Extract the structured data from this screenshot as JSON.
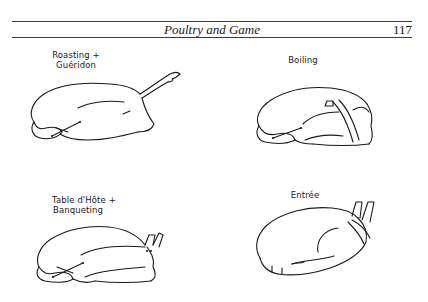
{
  "header": {
    "running_title": "Poultry and Game",
    "page_number": "117"
  },
  "figures": [
    {
      "id": "roasting",
      "caption_lines": [
        "Roasting +",
        "Guéridon"
      ],
      "illustration": "trussed-bird-roasting-icon"
    },
    {
      "id": "boiling",
      "caption_lines": [
        "Boiling"
      ],
      "illustration": "trussed-bird-boiling-icon"
    },
    {
      "id": "table-dhote",
      "caption_lines": [
        "Table d'Hôte +",
        "Banqueting"
      ],
      "illustration": "trussed-bird-table-dhote-icon"
    },
    {
      "id": "entree",
      "caption_lines": [
        "Entrée"
      ],
      "illustration": "trussed-bird-entree-icon"
    }
  ]
}
